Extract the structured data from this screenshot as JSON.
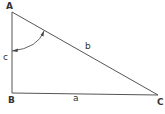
{
  "diagram": {
    "type": "right-triangle",
    "vertices": {
      "A": {
        "label": "A",
        "x": 12,
        "y": 12
      },
      "B": {
        "label": "B",
        "x": 12,
        "y": 93
      },
      "C": {
        "label": "C",
        "x": 158,
        "y": 95
      }
    },
    "sides": {
      "a": {
        "label": "a",
        "between": [
          "B",
          "C"
        ]
      },
      "b": {
        "label": "b",
        "between": [
          "A",
          "C"
        ]
      },
      "c": {
        "label": "c",
        "between": [
          "A",
          "B"
        ]
      }
    },
    "angle_arc": {
      "at_vertex": "A",
      "from_side": "c",
      "to_side": "b",
      "arrowheads": true
    },
    "right_angle_at": "B",
    "colors": {
      "stroke": "#555555",
      "text": "#333333",
      "background": "#ffffff"
    }
  }
}
